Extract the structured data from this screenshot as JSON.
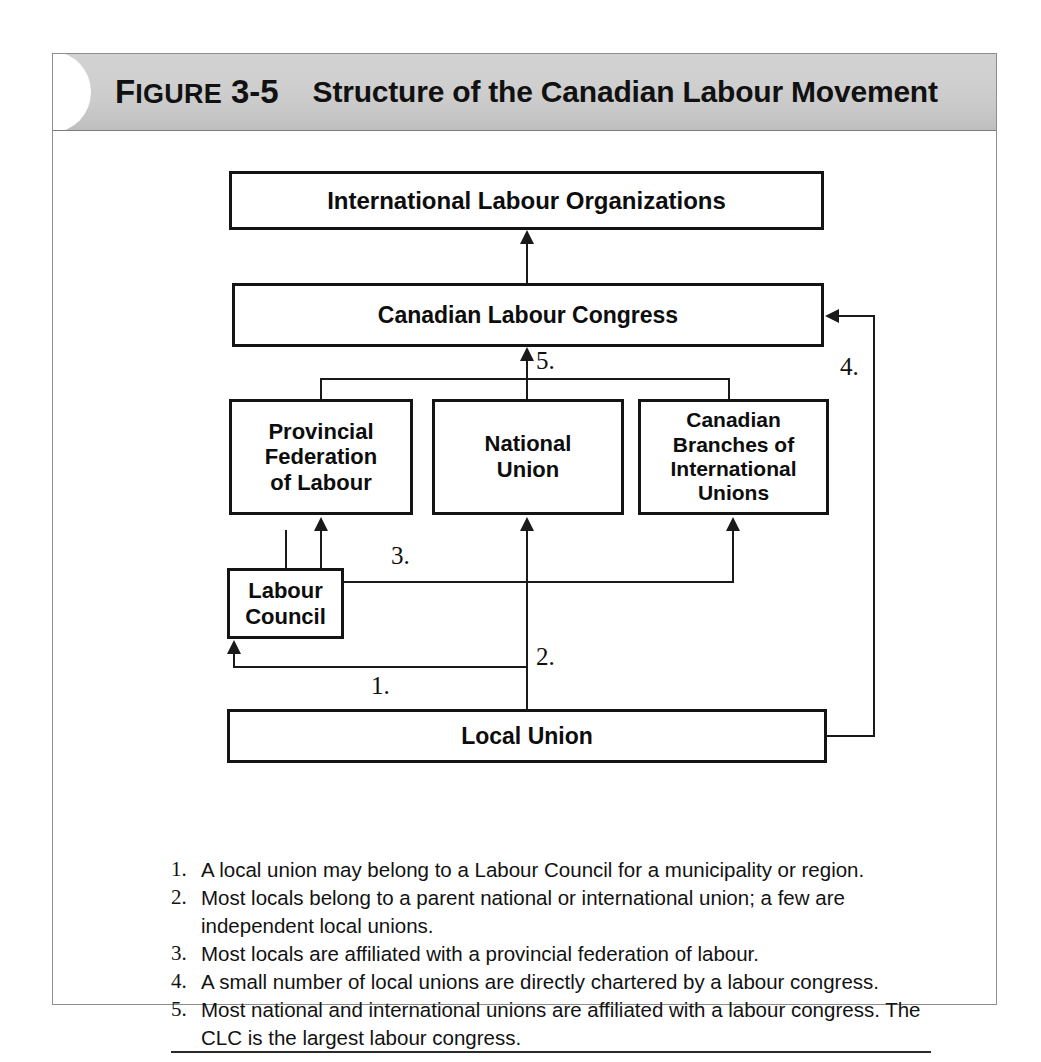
{
  "figure": {
    "label_prefix": "F",
    "label_rest": "IGURE",
    "number": "3-5",
    "title": "Structure of the Canadian Labour Movement"
  },
  "colors": {
    "banner_gray": "#cccccc",
    "frame_border": "#8d8d8d",
    "box_border": "#141414",
    "line": "#1a1a1a",
    "text": "#111111"
  },
  "diagram": {
    "nodes": [
      {
        "id": "international-labour-organizations",
        "label": "International Labour Organizations"
      },
      {
        "id": "canadian-labour-congress",
        "label": "Canadian Labour Congress"
      },
      {
        "id": "provincial-federation-of-labour",
        "label": "Provincial\nFederation\nof Labour"
      },
      {
        "id": "national-union",
        "label": "National\nUnion"
      },
      {
        "id": "canadian-branches-of-international-unions",
        "label": "Canadian\nBranches of\nInternational\nUnions"
      },
      {
        "id": "labour-council",
        "label": "Labour\nCouncil"
      },
      {
        "id": "local-union",
        "label": "Local Union"
      }
    ],
    "connector_labels": {
      "one": "1.",
      "two": "2.",
      "three": "3.",
      "four": "4.",
      "five": "5."
    },
    "edges": [
      {
        "from": "canadian-labour-congress",
        "to": "international-labour-organizations",
        "label": ""
      },
      {
        "from": "national-union",
        "to": "canadian-labour-congress",
        "label": "5."
      },
      {
        "from": "provincial-federation-of-labour",
        "to": "canadian-labour-congress",
        "label": "5."
      },
      {
        "from": "canadian-branches-of-international-unions",
        "to": "canadian-labour-congress",
        "label": "5."
      },
      {
        "from": "local-union",
        "to": "provincial-federation-of-labour",
        "label": "3."
      },
      {
        "from": "local-union",
        "to": "canadian-branches-of-international-unions",
        "label": "3."
      },
      {
        "from": "local-union",
        "to": "national-union",
        "label": "2."
      },
      {
        "from": "local-union",
        "to": "labour-council",
        "label": "1."
      },
      {
        "from": "local-union",
        "to": "canadian-labour-congress",
        "label": "4."
      }
    ]
  },
  "notes": [
    {
      "num": "1.",
      "text": "A local union may belong to a Labour Council for a municipality or region."
    },
    {
      "num": "2.",
      "text": "Most locals belong to a parent national or international union; a few are independent local unions."
    },
    {
      "num": "3.",
      "text": "Most locals are affiliated with a provincial federation of labour."
    },
    {
      "num": "4.",
      "text": "A small number of local unions are directly chartered by a labour congress."
    },
    {
      "num": "5.",
      "text": "Most national and international unions are affiliated with a labour congress. The CLC is the largest labour congress."
    }
  ]
}
